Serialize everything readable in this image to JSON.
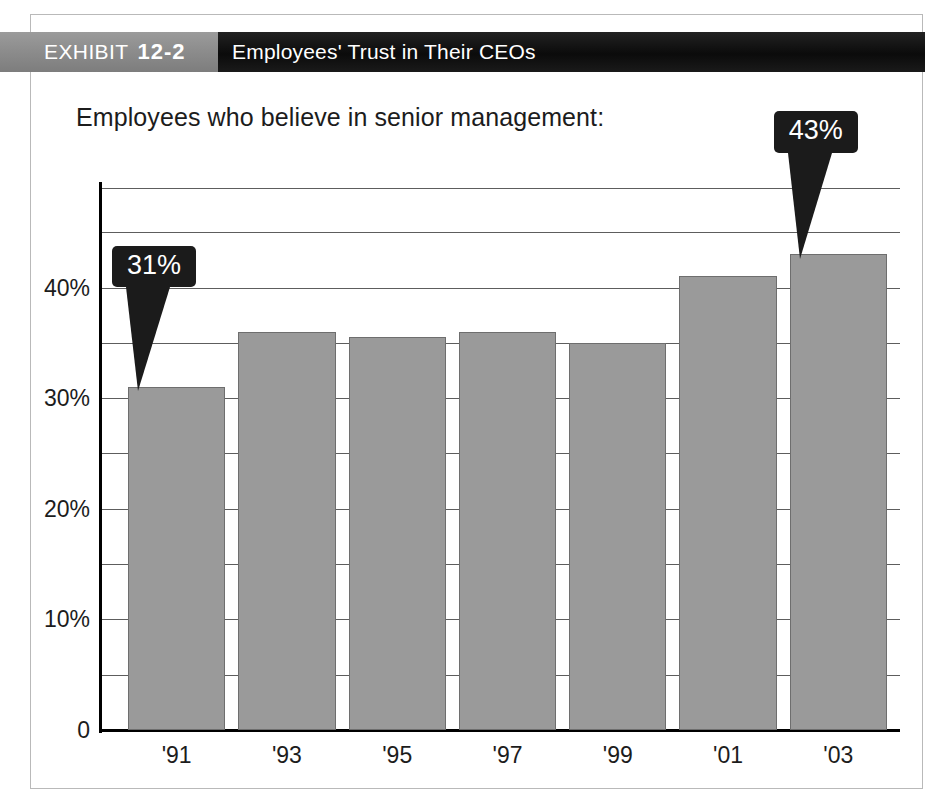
{
  "banner": {
    "exhibit_word": "EXHIBIT",
    "exhibit_number": "12-2",
    "title": "Employees' Trust in Their CEOs"
  },
  "subtitle": "Employees who believe in senior management:",
  "colors": {
    "banner_left": "#8d8d8d",
    "banner_right": "#0b0b0b",
    "bar_fill": "#9a9a9a",
    "bar_stroke": "#6e6e6e",
    "gridline": "#5d5d5d",
    "axis": "#000000",
    "callout_bg": "#1b1b1b",
    "callout_text": "#ffffff",
    "page_border": "#b9b9b9",
    "text": "#1c1c1c"
  },
  "chart_data": {
    "type": "bar",
    "title": "Employees' Trust in Their CEOs",
    "subtitle": "Employees who believe in senior management:",
    "xlabel": "",
    "ylabel": "",
    "categories": [
      "'91",
      "'93",
      "'95",
      "'97",
      "'99",
      "'01",
      "'03"
    ],
    "values": [
      31,
      36,
      35.5,
      36,
      35,
      41,
      43
    ],
    "ylim": [
      0,
      49
    ],
    "ytick_values": [
      0,
      10,
      20,
      30,
      40
    ],
    "ytick_labels": [
      "0",
      "10%",
      "20%",
      "30%",
      "40%"
    ],
    "gridline_values": [
      5,
      10,
      15,
      20,
      25,
      30,
      35,
      40,
      45,
      49
    ],
    "grid": true,
    "legend": "none",
    "annotations": [
      {
        "label": "31%",
        "category": "'91",
        "value": 31
      },
      {
        "label": "43%",
        "category": "'03",
        "value": 43
      }
    ]
  }
}
